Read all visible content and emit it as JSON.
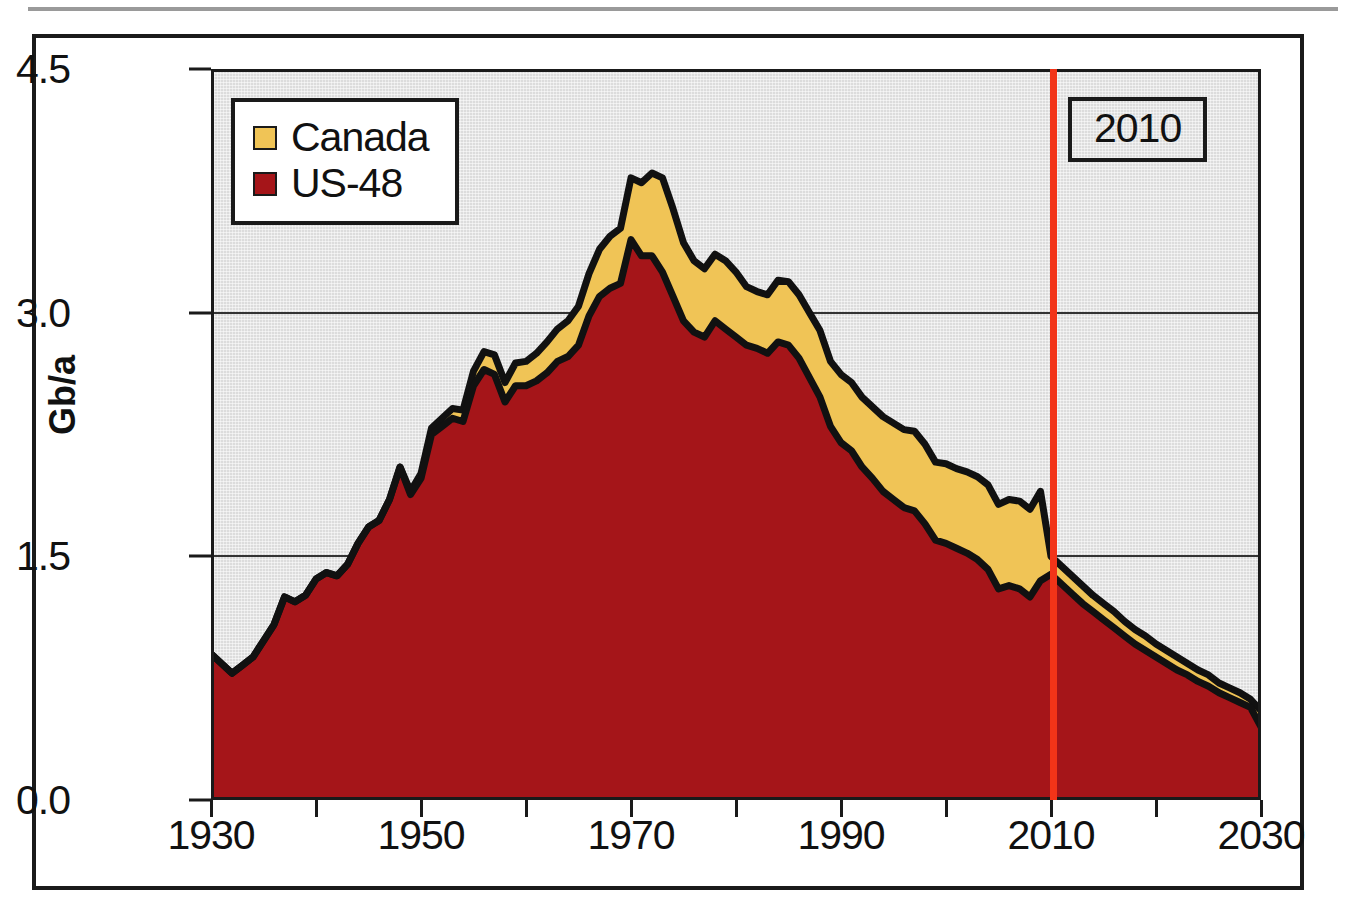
{
  "figure": {
    "ylabel": "Gb/a",
    "marker_label": "2010",
    "marker_year": 2010
  },
  "legend": {
    "items": [
      {
        "label": "Canada",
        "color": "#f0c456",
        "icon": "legend-swatch-canada"
      },
      {
        "label": "US-48",
        "color": "#a51519",
        "icon": "legend-swatch-us48"
      }
    ]
  },
  "axes": {
    "y_ticks": [
      "0.0",
      "1.5",
      "3.0",
      "4.5"
    ],
    "x_ticks": [
      "1930",
      "1950",
      "1970",
      "1990",
      "2010",
      "2030"
    ]
  },
  "chart_data": {
    "type": "area",
    "stacked": true,
    "title": "",
    "subtitle": "",
    "xlabel": "",
    "ylabel": "Gb/a",
    "xlim": [
      1930,
      2030
    ],
    "ylim": [
      0.0,
      4.5
    ],
    "yticks": [
      0.0,
      1.5,
      3.0,
      4.5
    ],
    "xticks": [
      1930,
      1950,
      1970,
      1990,
      2010,
      2030
    ],
    "x_minor_tick_step": 10,
    "grid": "horizontal-only",
    "legend_position": "top-left-inside",
    "plot_bgcolor": "#dcdcdc",
    "annotations": [
      {
        "type": "vline",
        "label": "2010",
        "x": 2010,
        "color": "#f23418",
        "boxed": true
      }
    ],
    "x": [
      1930,
      1931,
      1932,
      1933,
      1934,
      1935,
      1936,
      1937,
      1938,
      1939,
      1940,
      1941,
      1942,
      1943,
      1944,
      1945,
      1946,
      1947,
      1948,
      1949,
      1950,
      1951,
      1952,
      1953,
      1954,
      1955,
      1956,
      1957,
      1958,
      1959,
      1960,
      1961,
      1962,
      1963,
      1964,
      1965,
      1966,
      1967,
      1968,
      1969,
      1970,
      1971,
      1972,
      1973,
      1974,
      1975,
      1976,
      1977,
      1978,
      1979,
      1980,
      1981,
      1982,
      1983,
      1984,
      1985,
      1986,
      1987,
      1988,
      1989,
      1990,
      1991,
      1992,
      1993,
      1994,
      1995,
      1996,
      1997,
      1998,
      1999,
      2000,
      2001,
      2002,
      2003,
      2004,
      2005,
      2006,
      2007,
      2008,
      2009,
      2010,
      2011,
      2012,
      2013,
      2014,
      2015,
      2016,
      2017,
      2018,
      2019,
      2020,
      2021,
      2022,
      2023,
      2024,
      2025,
      2026,
      2027,
      2028,
      2029,
      2030
    ],
    "series": [
      {
        "name": "US-48",
        "color": "#a51519",
        "values": [
          0.9,
          0.84,
          0.78,
          0.83,
          0.88,
          0.98,
          1.08,
          1.25,
          1.22,
          1.26,
          1.36,
          1.4,
          1.38,
          1.45,
          1.58,
          1.68,
          1.72,
          1.85,
          2.05,
          1.88,
          1.98,
          2.25,
          2.3,
          2.35,
          2.33,
          2.55,
          2.65,
          2.62,
          2.45,
          2.55,
          2.55,
          2.58,
          2.63,
          2.7,
          2.73,
          2.8,
          2.98,
          3.1,
          3.15,
          3.18,
          3.45,
          3.35,
          3.35,
          3.25,
          3.1,
          2.95,
          2.88,
          2.85,
          2.95,
          2.9,
          2.85,
          2.8,
          2.78,
          2.75,
          2.82,
          2.8,
          2.72,
          2.6,
          2.48,
          2.3,
          2.2,
          2.15,
          2.05,
          1.98,
          1.9,
          1.85,
          1.8,
          1.78,
          1.7,
          1.6,
          1.58,
          1.55,
          1.52,
          1.48,
          1.42,
          1.3,
          1.32,
          1.3,
          1.25,
          1.35,
          1.39,
          1.33,
          1.27,
          1.21,
          1.16,
          1.11,
          1.06,
          1.01,
          0.96,
          0.92,
          0.88,
          0.84,
          0.8,
          0.77,
          0.73,
          0.7,
          0.66,
          0.63,
          0.6,
          0.57,
          0.45
        ]
      },
      {
        "name": "Canada",
        "color": "#f0c456",
        "values": [
          0.0,
          0.0,
          0.0,
          0.0,
          0.0,
          0.0,
          0.0,
          0.0,
          0.0,
          0.0,
          0.0,
          0.0,
          0.0,
          0.0,
          0.0,
          0.0,
          0.0,
          0.0,
          0.0,
          0.02,
          0.03,
          0.04,
          0.05,
          0.06,
          0.07,
          0.09,
          0.11,
          0.12,
          0.12,
          0.14,
          0.15,
          0.17,
          0.19,
          0.2,
          0.22,
          0.24,
          0.26,
          0.29,
          0.32,
          0.34,
          0.38,
          0.45,
          0.51,
          0.58,
          0.54,
          0.48,
          0.44,
          0.42,
          0.41,
          0.42,
          0.4,
          0.36,
          0.35,
          0.36,
          0.38,
          0.39,
          0.39,
          0.4,
          0.41,
          0.4,
          0.42,
          0.42,
          0.43,
          0.44,
          0.46,
          0.47,
          0.48,
          0.49,
          0.49,
          0.48,
          0.49,
          0.49,
          0.5,
          0.51,
          0.52,
          0.52,
          0.53,
          0.54,
          0.54,
          0.55,
          0.11,
          0.11,
          0.11,
          0.11,
          0.1,
          0.1,
          0.1,
          0.09,
          0.09,
          0.09,
          0.08,
          0.08,
          0.08,
          0.07,
          0.07,
          0.07,
          0.06,
          0.06,
          0.06,
          0.05,
          0.1
        ]
      }
    ],
    "total_peak": {
      "year": 1970,
      "value": 3.85
    },
    "value_at_marker": {
      "year": 2010,
      "total": 1.5
    },
    "value_at_end": {
      "year": 2030,
      "total": 0.55
    }
  }
}
